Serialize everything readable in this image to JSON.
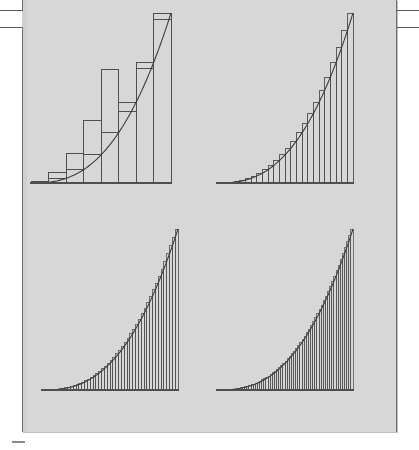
{
  "figure": {
    "background_color": "#d7d7d7",
    "page_color": "#ffffff",
    "ink_color": "#4a4a4a",
    "curve_color": "#3a3a3a"
  },
  "chart_data": {
    "type": "area",
    "xlabel": "",
    "ylabel": "",
    "xlim": [
      0,
      1
    ],
    "ylim": [
      0,
      1
    ],
    "grid": false,
    "legend": null,
    "curve": {
      "name": "f(x)",
      "shape": "convex increasing",
      "formula": "y = x^2.6",
      "x": [
        0,
        0.1,
        0.2,
        0.3,
        0.4,
        0.5,
        0.6,
        0.7,
        0.8,
        0.9,
        1.0
      ],
      "y": [
        0,
        0.0025,
        0.0151,
        0.0436,
        0.0912,
        0.1649,
        0.2661,
        0.3985,
        0.5657,
        0.7635,
        1.0
      ]
    },
    "panels": [
      {
        "id": "panel-top-left",
        "position": "top-left",
        "n_rectangles": 8,
        "rule": "right endpoint",
        "x_edges": [
          0,
          0.125,
          0.25,
          0.375,
          0.5,
          0.625,
          0.75,
          0.875,
          1.0
        ],
        "bar_heights": [
          0.004,
          0.0245,
          0.0692,
          0.149,
          0.2712,
          0.4415,
          0.6652,
          1.0
        ]
      },
      {
        "id": "panel-top-right",
        "position": "top-right",
        "n_rectangles": 24,
        "rule": "right endpoint",
        "bar_heights": [
          0.0002,
          0.0011,
          0.0032,
          0.0068,
          0.0122,
          0.0196,
          0.0293,
          0.0414,
          0.0562,
          0.0738,
          0.0943,
          0.118,
          0.1449,
          0.1752,
          0.209,
          0.2465,
          0.2878,
          0.333,
          0.3823,
          0.4358,
          0.4935,
          0.5556,
          0.6222,
          1.0
        ]
      },
      {
        "id": "panel-bottom-left",
        "position": "bottom-left",
        "n_rectangles": 48,
        "rule": "right endpoint",
        "bar_heights": []
      },
      {
        "id": "panel-bottom-right",
        "position": "bottom-right",
        "n_rectangles": 64,
        "rule": "right endpoint",
        "bar_heights": []
      }
    ]
  },
  "marks": {
    "left_rules": [
      {
        "y": 10,
        "width": 22
      },
      {
        "y": 27,
        "width": 22
      }
    ],
    "right_rules": [
      {
        "y": 10,
        "width": 22
      },
      {
        "y": 27,
        "width": 22
      }
    ],
    "bottom_dash": {
      "x": 12,
      "y": 441,
      "width": 13
    }
  }
}
